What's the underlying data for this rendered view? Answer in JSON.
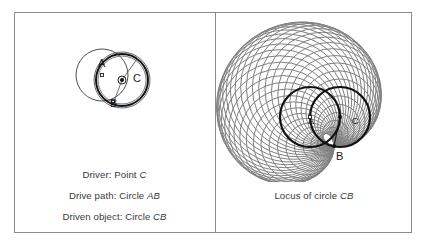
{
  "figure": {
    "background": "#ffffff",
    "frame_color": "#8c8c8c",
    "width": 427,
    "height": 246
  },
  "panels": [
    {
      "id": "left",
      "name": "driver-definition-panel",
      "captions": [
        {
          "prefix": "Driver: Point ",
          "italic": "C"
        },
        {
          "prefix": "Drive path: Circle ",
          "italic": "AB"
        },
        {
          "prefix": "Driven object: Circle ",
          "italic": "CB"
        }
      ],
      "diagram": {
        "name": "driver-circles-diagram",
        "labels": [
          {
            "text": "A",
            "x": 40,
            "y": 37
          },
          {
            "text": "B",
            "x": 52,
            "y": 77
          },
          {
            "text": "C",
            "x": 75,
            "y": 52
          }
        ],
        "circles": [
          {
            "name": "circle-AB",
            "cx": 44,
            "cy": 45,
            "r": 26,
            "stroke": "#3a3a3a",
            "width": 0.9,
            "fill": "none"
          },
          {
            "name": "circle-CB-outer",
            "cx": 64,
            "cy": 50,
            "r": 28,
            "stroke": "#555555",
            "width": 0.9,
            "fill": "none"
          },
          {
            "name": "circle-CB-bold",
            "cx": 64,
            "cy": 50,
            "r": 26,
            "stroke": "#111111",
            "width": 2.0,
            "fill": "none"
          },
          {
            "name": "circle-CB-inner",
            "cx": 64,
            "cy": 50,
            "r": 24,
            "stroke": "#555555",
            "width": 0.8,
            "fill": "none"
          },
          {
            "name": "point-C-ring",
            "cx": 64,
            "cy": 50,
            "r": 4,
            "stroke": "#1a1a1a",
            "width": 1.0,
            "fill": "none"
          }
        ],
        "markers": [
          {
            "name": "point-A-marker",
            "shape": "square",
            "x": 44,
            "y": 45,
            "size": 3
          },
          {
            "name": "point-C-marker",
            "shape": "dot",
            "x": 64,
            "y": 50,
            "size": 2
          },
          {
            "name": "point-B-marker",
            "shape": "square",
            "x": 55,
            "y": 72,
            "size": 3
          }
        ],
        "radii": [
          {
            "name": "radius-C-to-top",
            "x1": 64,
            "y1": 50,
            "x2": 79,
            "y2": 29
          },
          {
            "name": "radius-C-to-B",
            "x1": 64,
            "y1": 50,
            "x2": 55,
            "y2": 74
          }
        ]
      }
    },
    {
      "id": "right",
      "name": "locus-panel",
      "captions": [
        {
          "prefix": "Locus of circle ",
          "italic": "CB"
        }
      ],
      "diagram": {
        "name": "locus-of-circle-cb-diagram",
        "labels": [
          {
            "text": "A",
            "x": 60,
            "y": 100
          },
          {
            "text": "B",
            "x": 88,
            "y": 136
          },
          {
            "text": "C",
            "x": 104,
            "y": 100
          }
        ],
        "locus": {
          "name": "locus-envelope",
          "count": 44,
          "stroke": "#6a6a6a",
          "stroke_width": 1.0,
          "pivot": {
            "x": 86,
            "y": 122
          },
          "drive_center": {
            "x": 62,
            "y": 93
          },
          "drive_radius": 30
        },
        "overlay_circles": [
          {
            "name": "circle-AB-bold",
            "cx": 62,
            "cy": 93,
            "r": 30,
            "stroke": "#111111",
            "width": 2.2
          },
          {
            "name": "circle-CB-bold",
            "cx": 92,
            "cy": 93,
            "r": 30,
            "stroke": "#111111",
            "width": 2.2
          }
        ],
        "markers": [
          {
            "name": "point-A-marker",
            "shape": "square",
            "x": 62,
            "y": 93,
            "size": 3
          },
          {
            "name": "point-C-marker",
            "shape": "dot",
            "x": 92,
            "y": 93,
            "size": 2
          },
          {
            "name": "point-B-marker",
            "shape": "dot",
            "x": 86,
            "y": 122,
            "size": 2
          }
        ]
      }
    }
  ]
}
